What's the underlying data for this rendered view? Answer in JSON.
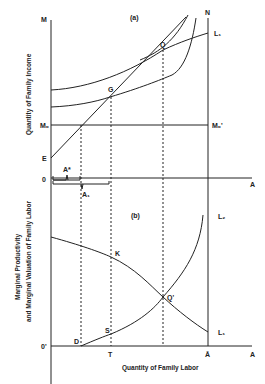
{
  "panel_a": {
    "title": "(a)",
    "y_axis_label": "Quantity of Family Income",
    "labels": {
      "M": "M",
      "N": "N",
      "L1": "L₁",
      "Q": "Q",
      "G": "G",
      "M0": "M₀",
      "M0_prime": "M₀'",
      "E": "E",
      "O": "0",
      "A": "A",
      "A_star": "A*",
      "A1": "A₁"
    }
  },
  "panel_b": {
    "title": "(b)",
    "y_axis_label_line1": "Marginal Productivity",
    "y_axis_label_line2": "and Marginal Valuation of Family Labor",
    "x_axis_label": "Quantity of Family Labor",
    "labels": {
      "L2": "L₂",
      "L1": "L₁",
      "K": "K",
      "Q_prime": "Q'",
      "S": "S",
      "D": "D",
      "O_prime": "0'",
      "T": "T",
      "A_bar": "Ā",
      "A": "A"
    }
  },
  "colors": {
    "ink": "#222222",
    "background": "#ffffff"
  }
}
